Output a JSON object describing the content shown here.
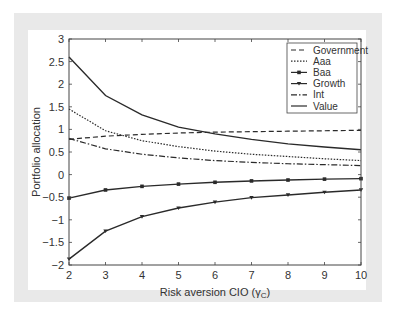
{
  "chart_data": {
    "type": "line",
    "title": "",
    "xlabel": "Risk aversion CIO (γC)",
    "ylabel": "Portfolio allocation",
    "x": [
      2,
      3,
      4,
      5,
      6,
      7,
      8,
      9,
      10
    ],
    "xlim": [
      2,
      10
    ],
    "ylim": [
      -2,
      3
    ],
    "xticks": [
      "2",
      "3",
      "4",
      "5",
      "6",
      "7",
      "8",
      "9",
      "10"
    ],
    "yticks": [
      "-2",
      "-1.5",
      "-1",
      "-0.5",
      "0",
      "0.5",
      "1",
      "1.5",
      "2",
      "2.5",
      "3"
    ],
    "grid": false,
    "legend_position": "upper right",
    "series": [
      {
        "name": "Government",
        "style": "dashed",
        "marker": "none",
        "values": [
          0.78,
          0.85,
          0.89,
          0.92,
          0.94,
          0.95,
          0.96,
          0.97,
          0.98
        ]
      },
      {
        "name": "Aaa",
        "style": "dotted",
        "marker": "none",
        "values": [
          1.45,
          0.97,
          0.75,
          0.62,
          0.52,
          0.45,
          0.4,
          0.35,
          0.31
        ]
      },
      {
        "name": "Baa",
        "style": "solid",
        "marker": "square",
        "values": [
          -0.52,
          -0.34,
          -0.26,
          -0.21,
          -0.17,
          -0.14,
          -0.12,
          -0.1,
          -0.09
        ]
      },
      {
        "name": "Growth",
        "style": "solid",
        "marker": "triangle-down",
        "values": [
          -1.87,
          -1.25,
          -0.93,
          -0.74,
          -0.61,
          -0.51,
          -0.45,
          -0.39,
          -0.34
        ]
      },
      {
        "name": "Int",
        "style": "dashdot",
        "marker": "none",
        "values": [
          0.8,
          0.57,
          0.45,
          0.37,
          0.31,
          0.27,
          0.24,
          0.22,
          0.2
        ]
      },
      {
        "name": "Value",
        "style": "solid",
        "marker": "none",
        "values": [
          2.6,
          1.75,
          1.32,
          1.05,
          0.9,
          0.78,
          0.68,
          0.61,
          0.55
        ]
      }
    ]
  },
  "axes": {
    "xlabel_main": "Risk aversion CIO (",
    "xlabel_sym": "γ",
    "xlabel_sub": "C",
    "xlabel_end": ")",
    "ylabel": "Portfolio allocation"
  },
  "legend": {
    "items": [
      "Government",
      "Aaa",
      "Baa",
      "Growth",
      "Int",
      "Value"
    ]
  },
  "colors": {
    "line": "#2a2a2a",
    "frame": "#e9e9e9",
    "axis": "#444444"
  }
}
